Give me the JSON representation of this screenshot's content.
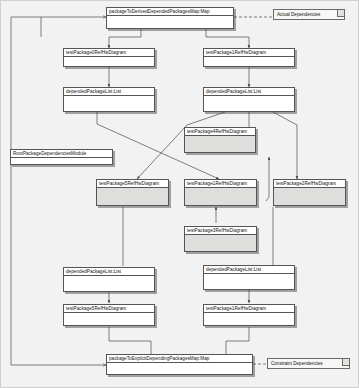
{
  "diagram": {
    "type": "package-dependency-object-diagram",
    "canvas": {
      "width": 359,
      "height": 388,
      "background": "#f2f2f2"
    },
    "colors": {
      "node_fill": "#ffffff",
      "shaded_fill": "#dededc",
      "note_fill": "#f7f7f5",
      "border": "#555555",
      "edge": "#4a4a4a"
    }
  },
  "nodes": {
    "derived_map": {
      "label": "packageToDerivedDependedPackagesMap:Map"
    },
    "explicit_map": {
      "label": "packageToExplicitDependingPackagesMap:Map"
    },
    "module": {
      "label": "RootPackageDependenciesModule"
    },
    "ref0_top": {
      "label": "testPackage0RefHwDiagram"
    },
    "ref1_top": {
      "label": "testPackage1RefHwDiagram"
    },
    "depended_list_top_left": {
      "label": "dependedPackageList:List"
    },
    "depended_list_top_right": {
      "label": "dependedPackageList:List"
    },
    "ref4_center": {
      "label": "testPackage4RefHwDiagram"
    },
    "ref5_center": {
      "label": "testPackage5RefHwDiagram"
    },
    "ref1_center": {
      "label": "testPackage1RefHwDiagram"
    },
    "ref2_center": {
      "label": "testPackage2RefHwDiagram"
    },
    "ref3_center": {
      "label": "testPackage3RefHwDiagram"
    },
    "depended_list_bottom_left": {
      "label": "dependedPackageList:List"
    },
    "depended_list_bottom_right": {
      "label": "dependedPackageList:List"
    },
    "ref5_bottom": {
      "label": "testPackage5RefHwDiagram"
    },
    "ref1_bottom": {
      "label": "testPackage1RefHwDiagram"
    }
  },
  "notes": {
    "actual": {
      "label": "Actual Dependencies"
    },
    "constraint": {
      "label": "Constraint Dependencies"
    }
  }
}
